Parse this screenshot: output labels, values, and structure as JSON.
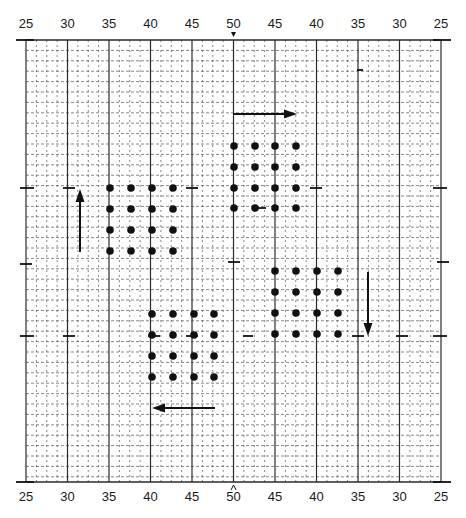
{
  "diagram": {
    "type": "grid-chart-with-dot-patterns",
    "frame": {
      "left": 26,
      "right": 441,
      "top": 40,
      "bottom": 482
    },
    "major_spacing_px": 41.5,
    "minor_divisions": 4,
    "row_spacing_px": 10.4,
    "top_axis_labels": [
      "25",
      "30",
      "35",
      "40",
      "45",
      "50",
      "45",
      "40",
      "35",
      "30",
      "25"
    ],
    "bottom_axis_labels": [
      "25",
      "30",
      "35",
      "40",
      "45",
      "50",
      "45",
      "40",
      "35",
      "30",
      "25"
    ],
    "center_marker_top": "v",
    "center_marker_bottom": "^",
    "colors": {
      "line": "#2a2a2a",
      "minor": "#555555",
      "dot": "#111111",
      "background": "#ffffff"
    },
    "dot_groups": [
      {
        "name": "upper-left",
        "xs": [
          110,
          131,
          152,
          173
        ],
        "ys": [
          188,
          209,
          230,
          251
        ]
      },
      {
        "name": "upper-right",
        "xs": [
          234,
          255,
          275,
          296
        ],
        "ys": [
          146,
          167,
          188,
          208
        ]
      },
      {
        "name": "right",
        "xs": [
          275,
          296,
          317,
          338
        ],
        "ys": [
          271,
          292,
          313,
          334
        ]
      },
      {
        "name": "lower",
        "xs": [
          152,
          173,
          194,
          214
        ],
        "ys": [
          314,
          335,
          356,
          377
        ]
      }
    ],
    "arrows": [
      {
        "name": "arrow-up",
        "x1": 80,
        "y1": 252,
        "x2": 80,
        "y2": 189,
        "direction": "up"
      },
      {
        "name": "arrow-right",
        "x1": 234,
        "y1": 114,
        "x2": 297,
        "y2": 114,
        "direction": "right"
      },
      {
        "name": "arrow-down",
        "x1": 368,
        "y1": 272,
        "x2": 368,
        "y2": 336,
        "direction": "down"
      },
      {
        "name": "arrow-left",
        "x1": 215,
        "y1": 408,
        "x2": 152,
        "y2": 408,
        "direction": "left"
      }
    ],
    "tick_marks": [
      {
        "x1": 16,
        "x2": 34,
        "y": 40
      },
      {
        "x1": 433,
        "x2": 451,
        "y": 40
      },
      {
        "x1": 16,
        "x2": 34,
        "y": 482
      },
      {
        "x1": 433,
        "x2": 451,
        "y": 482
      },
      {
        "x1": 20,
        "x2": 34,
        "y": 188
      },
      {
        "x1": 63,
        "x2": 75,
        "y": 188
      },
      {
        "x1": 186,
        "x2": 198,
        "y": 188
      },
      {
        "x1": 310,
        "x2": 322,
        "y": 188
      },
      {
        "x1": 433,
        "x2": 447,
        "y": 188
      },
      {
        "x1": 20,
        "x2": 32,
        "y": 264
      },
      {
        "x1": 228,
        "x2": 240,
        "y": 262
      },
      {
        "x1": 437,
        "x2": 449,
        "y": 262
      },
      {
        "x1": 20,
        "x2": 34,
        "y": 336
      },
      {
        "x1": 63,
        "x2": 75,
        "y": 336
      },
      {
        "x1": 148,
        "x2": 160,
        "y": 336
      },
      {
        "x1": 186,
        "x2": 198,
        "y": 336
      },
      {
        "x1": 243,
        "x2": 253,
        "y": 336
      },
      {
        "x1": 352,
        "x2": 364,
        "y": 336
      },
      {
        "x1": 396,
        "x2": 408,
        "y": 336
      },
      {
        "x1": 433,
        "x2": 447,
        "y": 336
      },
      {
        "x1": 357,
        "x2": 363,
        "y": 70
      },
      {
        "x1": 256,
        "x2": 266,
        "y": 208
      }
    ]
  }
}
